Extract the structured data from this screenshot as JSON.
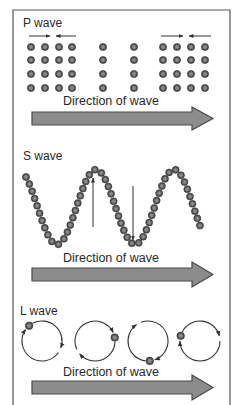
{
  "figure": {
    "frame_color": "#555555",
    "dot_color": "#5a5a5a",
    "dot_highlight": "#8a8a8a",
    "arrow_fill": "#8c8c8c",
    "arrow_stroke": "#4a4a4a",
    "line_color": "#333333"
  },
  "panels": [
    {
      "id": "p-wave",
      "label": "P wave",
      "direction_label": "Direction of wave",
      "dot_columns_x": [
        31,
        45,
        59,
        72,
        103,
        134,
        163,
        177,
        191,
        205
      ],
      "dot_rows_y": [
        47,
        60,
        74,
        88
      ],
      "compression_arrows": [
        {
          "from": 29,
          "to": 50,
          "y": 36,
          "dir": "right"
        },
        {
          "from": 76,
          "to": 56,
          "y": 36,
          "dir": "left"
        },
        {
          "from": 161,
          "to": 183,
          "y": 36,
          "dir": "right"
        },
        {
          "from": 211,
          "to": 189,
          "y": 36,
          "dir": "left"
        }
      ]
    },
    {
      "id": "s-wave",
      "label": "S wave",
      "direction_label": "Direction of wave",
      "motion_arrows": [
        {
          "x": 93,
          "from": 227,
          "to": 178,
          "dir": "up"
        },
        {
          "x": 133,
          "from": 186,
          "to": 240,
          "dir": "down"
        }
      ]
    },
    {
      "id": "l-wave",
      "label": "L wave",
      "direction_label": "Direction of wave",
      "circles": [
        {
          "cx": 42,
          "cy": 341,
          "r": 20,
          "dot_angle_deg": 130
        },
        {
          "cx": 95,
          "cy": 341,
          "r": 20,
          "dot_angle_deg": 10
        },
        {
          "cx": 148,
          "cy": 341,
          "r": 20,
          "dot_angle_deg": 275
        },
        {
          "cx": 200,
          "cy": 341,
          "r": 20,
          "dot_angle_deg": 165
        }
      ]
    }
  ]
}
